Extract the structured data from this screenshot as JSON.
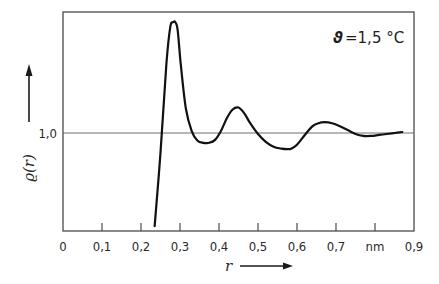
{
  "chart_data": {
    "type": "line",
    "title": "",
    "annotation": {
      "symbol": "ϑ",
      "text": "=1,5 °C"
    },
    "xlabel": "r",
    "ylabel": "ϱ(r)",
    "xunit": "nm",
    "xlim": [
      0,
      0.9
    ],
    "ylim": [
      0,
      2.2
    ],
    "xticks": [
      0,
      0.1,
      0.2,
      0.3,
      0.4,
      0.5,
      0.6,
      0.7,
      0.8,
      0.9
    ],
    "xtick_labels": [
      "0",
      "0,1",
      "0,2",
      "0,3",
      "0,4",
      "0,5",
      "0,6",
      "0,7",
      "nm",
      "0,9"
    ],
    "yticks": [
      1.0
    ],
    "ytick_labels": [
      "1,0"
    ],
    "reference_line": 1.0,
    "grid": false,
    "series": [
      {
        "name": "ϱ(r)",
        "x": [
          0.235,
          0.25,
          0.265,
          0.275,
          0.282,
          0.288,
          0.294,
          0.302,
          0.315,
          0.33,
          0.345,
          0.36,
          0.375,
          0.39,
          0.405,
          0.42,
          0.435,
          0.45,
          0.465,
          0.48,
          0.5,
          0.52,
          0.54,
          0.56,
          0.575,
          0.585,
          0.6,
          0.62,
          0.64,
          0.655,
          0.67,
          0.69,
          0.71,
          0.73,
          0.75,
          0.77,
          0.79,
          0.81,
          0.83,
          0.85,
          0.87
        ],
        "y": [
          0.05,
          0.8,
          1.7,
          2.08,
          2.13,
          2.13,
          2.05,
          1.7,
          1.25,
          1.02,
          0.92,
          0.9,
          0.9,
          0.93,
          1.02,
          1.15,
          1.24,
          1.26,
          1.2,
          1.1,
          0.99,
          0.91,
          0.86,
          0.84,
          0.835,
          0.84,
          0.88,
          0.98,
          1.07,
          1.1,
          1.11,
          1.1,
          1.07,
          1.03,
          0.99,
          0.97,
          0.97,
          0.98,
          0.99,
          1.0,
          1.01
        ]
      }
    ]
  }
}
